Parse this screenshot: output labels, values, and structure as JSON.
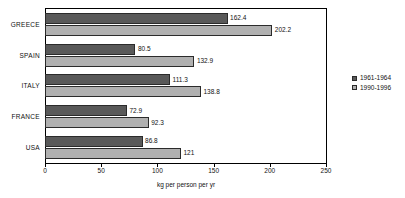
{
  "chart_data": {
    "type": "bar",
    "orientation": "horizontal",
    "title": "",
    "xlabel": "kg per person per yr",
    "ylabel": "",
    "xlim": [
      0,
      250
    ],
    "xticks": [
      0,
      50,
      100,
      150,
      200,
      250
    ],
    "xtick_labels": [
      "0",
      "50",
      "100",
      "150",
      "200",
      "250"
    ],
    "grid": false,
    "legend_position": "right",
    "categories": [
      "GREECE",
      "SPAIN",
      "ITALY",
      "FRANCE",
      "USA"
    ],
    "series": [
      {
        "name": "1961-1964",
        "color": "#595959",
        "values": [
          162.4,
          80.5,
          111.3,
          72.9,
          86.8
        ],
        "value_labels": [
          "162.4",
          "80.5",
          "111.3",
          "72.9",
          "86.8"
        ]
      },
      {
        "name": "1990-1996",
        "color": "#b0b0b0",
        "values": [
          202.2,
          132.9,
          138.8,
          92.3,
          121
        ],
        "value_labels": [
          "202.2",
          "132.9",
          "138.8",
          "92.3",
          "121"
        ]
      }
    ]
  }
}
